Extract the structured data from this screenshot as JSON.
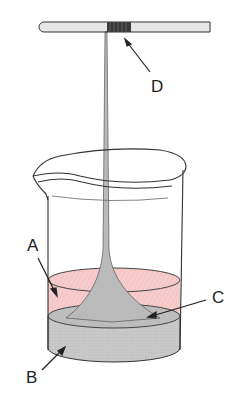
{
  "diagram": {
    "labels": {
      "A": "A",
      "B": "B",
      "C": "C",
      "D": "D"
    },
    "colors": {
      "upper_liquid": "#f4c6c6",
      "lower_liquid": "#c9c9c9",
      "fiber": "#bdbdbd",
      "rod": "#e4e4e4",
      "rod_wrap": "#3a3a3a",
      "outline": "#333333"
    },
    "components": [
      {
        "id": "rod",
        "description": "horizontal rod with fiber wound on it"
      },
      {
        "id": "beaker",
        "description": "glass beaker"
      },
      {
        "id": "A",
        "description": "upper liquid layer (pink)"
      },
      {
        "id": "B",
        "description": "lower liquid layer (gray)"
      },
      {
        "id": "C",
        "description": "interface where fiber forms"
      },
      {
        "id": "D",
        "description": "fiber wound on rod"
      }
    ]
  }
}
